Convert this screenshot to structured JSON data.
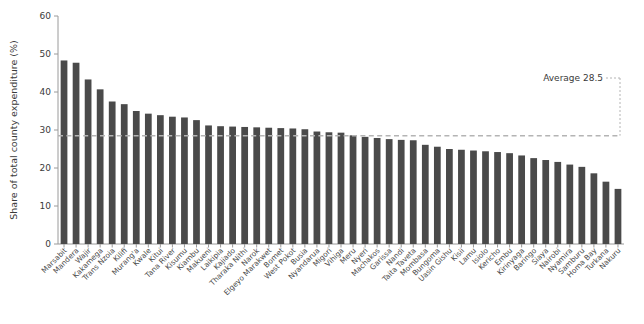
{
  "chart_data": {
    "type": "bar",
    "title": "",
    "subtitle": "",
    "xlabel": "",
    "ylabel": "Share of total county expenditure (%)",
    "ylim": [
      0,
      60
    ],
    "yticks": [
      0,
      10,
      20,
      30,
      40,
      50,
      60
    ],
    "grid": false,
    "legend": null,
    "bar_color": "#4a4a4a",
    "annotations": [
      {
        "name": "average-annotation",
        "text": "Average 28.5",
        "value": 28.5,
        "style": "dashed horizontal reference line across plot with dotted leader at right"
      }
    ],
    "categories": [
      "Marsabit",
      "Mandera",
      "Wajir",
      "Kakamega",
      "Trans Nzoia",
      "Kilifi",
      "Murang'a",
      "Kwale",
      "Kitui",
      "Tana River",
      "Kisumu",
      "Kiambu",
      "Makueni",
      "Laikipia",
      "Kajiado",
      "Tharaka Nithi",
      "Narok",
      "Elgeyo Marakwet",
      "Bomet",
      "West Pokot",
      "Busia",
      "Nyandarua",
      "Migori",
      "Vihiga",
      "Meru",
      "Nyeri",
      "Machakos",
      "Garissa",
      "Nandi",
      "Taita Taveta",
      "Mombasa",
      "Bungoma",
      "Uasin Gishu",
      "Kisii",
      "Lamu",
      "Isiolo",
      "Kericho",
      "Embu",
      "Kirinyaga",
      "Baringo",
      "Siaya",
      "Nairobi",
      "Nyamira",
      "Samburu",
      "Homa Bay",
      "Turkana",
      "Nakuru"
    ],
    "values": [
      48.3,
      47.7,
      43.3,
      40.7,
      37.5,
      36.8,
      35.0,
      34.3,
      33.9,
      33.5,
      33.3,
      32.6,
      31.2,
      31.0,
      30.9,
      30.8,
      30.7,
      30.6,
      30.5,
      30.4,
      30.2,
      29.6,
      29.4,
      29.3,
      28.6,
      28.2,
      27.9,
      27.6,
      27.4,
      27.3,
      26.1,
      25.6,
      25.0,
      24.8,
      24.6,
      24.4,
      24.2,
      23.9,
      23.3,
      22.6,
      22.1,
      21.6,
      20.9,
      20.3,
      18.6,
      16.4,
      14.5
    ]
  },
  "axes": {
    "y_tick_labels": [
      "0",
      "10",
      "20",
      "30",
      "40",
      "50",
      "60"
    ],
    "y_axis_title": "Share of total county expenditure (%)"
  }
}
